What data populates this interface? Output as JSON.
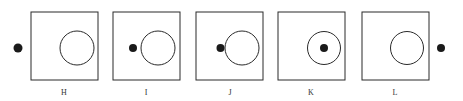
{
  "diagram": {
    "colors": {
      "stroke": "#2a2a2a",
      "dot": "#1a1a1a",
      "background": "#ffffff"
    },
    "panels": [
      {
        "label": "H",
        "box_x": 31,
        "circle_cx": 77,
        "dot_cx": 18,
        "dot_position": "outside-left-of-box"
      },
      {
        "label": "I",
        "box_x": 113,
        "circle_cx": 158,
        "dot_cx": 133,
        "dot_position": "inside-box-left-of-circle"
      },
      {
        "label": "J",
        "box_x": 196,
        "circle_cx": 242,
        "dot_cx": 220,
        "dot_position": "touching-circle-edge"
      },
      {
        "label": "K",
        "box_x": 278,
        "circle_cx": 324,
        "dot_cx": 324,
        "dot_position": "inside-circle-center"
      },
      {
        "label": "L",
        "box_x": 362,
        "circle_cx": 407,
        "dot_cx": 441,
        "dot_position": "outside-right-of-box"
      }
    ]
  }
}
